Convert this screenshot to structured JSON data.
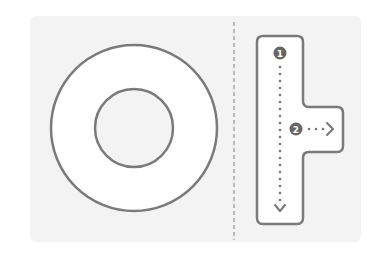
{
  "diagram": {
    "colors": {
      "panel_bg": "#f3f3f3",
      "stroke": "#7a7a7a",
      "fill_white": "#ffffff",
      "divider": "#9a9a9a",
      "badge": "#666666",
      "dots": "#777777"
    },
    "left_figure": {
      "shape": "ring",
      "outer_radius": 83,
      "inner_radius": 39
    },
    "right_figure": {
      "shape": "T-shaped scroll path",
      "badges": [
        {
          "label": "1",
          "meaning": "start point"
        },
        {
          "label": "2",
          "meaning": "branch point"
        }
      ],
      "arrows": [
        {
          "direction": "down"
        },
        {
          "direction": "right"
        }
      ]
    }
  }
}
